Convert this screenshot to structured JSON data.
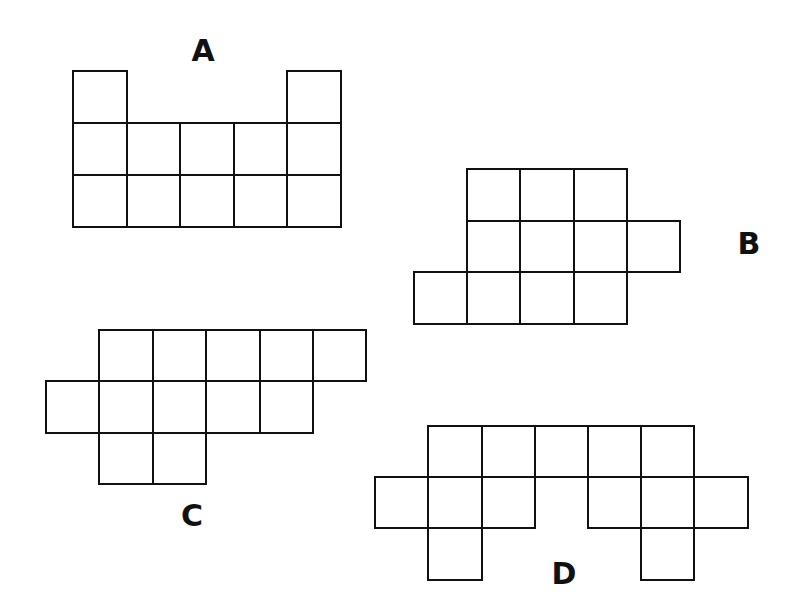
{
  "diagram": {
    "title": "",
    "line_color": "#111111",
    "background": "#ffffff",
    "shapes": [
      {
        "label": "A",
        "label_pos": [
          203,
          36
        ],
        "cols_x": [
          73,
          127,
          180,
          234,
          287,
          341
        ],
        "rows_y": [
          71,
          123,
          175,
          227
        ],
        "rows": [
          [
            0,
            4
          ],
          [
            0,
            1,
            2,
            3,
            4
          ],
          [
            0,
            1,
            2,
            3,
            4
          ]
        ]
      },
      {
        "label": "B",
        "label_pos": [
          749,
          229
        ],
        "cols_x": [
          414,
          467,
          520,
          574,
          627,
          680
        ],
        "rows_y": [
          169,
          221,
          272,
          324
        ],
        "rows": [
          [
            1,
            2,
            3
          ],
          [
            1,
            2,
            3,
            4
          ],
          [
            0,
            1,
            2,
            3
          ]
        ]
      },
      {
        "label": "C",
        "label_pos": [
          192,
          501
        ],
        "cols_x": [
          46,
          99,
          153,
          206,
          260,
          313,
          366
        ],
        "rows_y": [
          330,
          381,
          433,
          484
        ],
        "rows": [
          [
            1,
            2,
            3,
            4,
            5
          ],
          [
            0,
            1,
            2,
            3,
            4
          ],
          [
            1,
            2
          ]
        ]
      },
      {
        "label": "D",
        "label_pos": [
          564,
          559
        ],
        "cols_x": [
          375,
          428,
          482,
          535,
          588,
          641,
          694,
          748
        ],
        "rows_y": [
          426,
          477,
          528,
          580
        ],
        "rows": [
          [
            1,
            2,
            3,
            4,
            5
          ],
          [
            0,
            1,
            2,
            4,
            5,
            6
          ],
          [
            1,
            5
          ]
        ]
      }
    ]
  }
}
